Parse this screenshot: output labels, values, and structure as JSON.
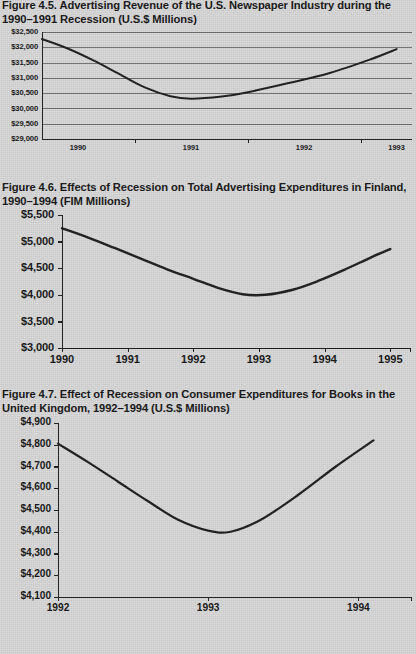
{
  "page": {
    "background_color": "#d7d7d7",
    "text_color": "#111111",
    "line_color": "#1a1a1a"
  },
  "figures": [
    {
      "id": "figure-4-5",
      "title": "Figure 4.5.  Advertising Revenue of the U.S. Newspaper Industry during the 1990–1991 Recession (U.S.$ Millions)"
    },
    {
      "id": "figure-4-6",
      "title": "Figure 4.6.  Effects of Recession on Total Advertising Expenditures in Finland, 1990–1994 (FIM Millions)"
    },
    {
      "id": "figure-4-7",
      "title": "Figure 4.7.  Effect of Recession on Consumer Expenditures for Books in the United Kingdom, 1992–1994 (U.S.$ Millions)"
    }
  ],
  "chart_data": [
    {
      "type": "line",
      "title": "Figure 4.5.  Advertising Revenue of the U.S. Newspaper Industry during the 1990–1991 Recession (U.S.$ Millions)",
      "xlabel": "",
      "ylabel": "",
      "grid": true,
      "legend": "none",
      "ytick_labels": [
        "$32,500",
        "$32,000",
        "$31,500",
        "$31,000",
        "$30,500",
        "$30,000",
        "$29,500",
        "$29,000"
      ],
      "ytick_values": [
        32500,
        32000,
        31500,
        31000,
        30500,
        30000,
        29500,
        29000
      ],
      "ylim": [
        29000,
        32500
      ],
      "xtick_labels": [
        "1990",
        "1991",
        "1992",
        "1993"
      ],
      "xlim": [
        1990,
        1993.6
      ],
      "series": [
        {
          "name": "U.S. newspaper advertising revenue",
          "x": [
            1990.0,
            1990.25,
            1990.5,
            1990.75,
            1991.0,
            1991.25,
            1991.45,
            1991.75,
            1992.0,
            1992.4,
            1992.8,
            1993.2,
            1993.45
          ],
          "values": [
            32270,
            31960,
            31570,
            31130,
            30690,
            30400,
            30320,
            30390,
            30530,
            30830,
            31160,
            31610,
            31940
          ]
        }
      ]
    },
    {
      "type": "line",
      "title": "Figure 4.6.  Effects of Recession on Total Advertising Expenditures in Finland, 1990–1994 (FIM Millions)",
      "xlabel": "",
      "ylabel": "",
      "grid": false,
      "legend": "none",
      "ytick_labels": [
        "$5,500",
        "$5,000",
        "$4,500",
        "$4,000",
        "$3,500",
        "$3,000"
      ],
      "ytick_values": [
        5500,
        5000,
        4500,
        4000,
        3500,
        3000
      ],
      "ylim": [
        3000,
        5500
      ],
      "xtick_labels": [
        "1990",
        "1991",
        "1992",
        "1993",
        "1994",
        "1995"
      ],
      "xlim": [
        1990,
        1995.3
      ],
      "series": [
        {
          "name": "Total advertising expenditures in Finland",
          "x": [
            1990.0,
            1990.4,
            1990.8,
            1991.2,
            1991.6,
            1992.0,
            1992.4,
            1992.75,
            1993.1,
            1993.5,
            1993.9,
            1994.3,
            1994.7,
            1995.0
          ],
          "values": [
            5250,
            5075,
            4880,
            4680,
            4480,
            4300,
            4120,
            4010,
            4000,
            4090,
            4260,
            4470,
            4700,
            4860
          ]
        }
      ]
    },
    {
      "type": "line",
      "title": "Figure 4.7.  Effect of Recession on Consumer Expenditures for Books in the United Kingdom, 1992–1994 (U.S.$ Millions)",
      "xlabel": "",
      "ylabel": "",
      "grid": false,
      "legend": "none",
      "ytick_labels": [
        "$4,900",
        "$4,800",
        "$4,700",
        "$4,600",
        "$4,500",
        "$4,400",
        "$4,300",
        "$4,200",
        "$4,100"
      ],
      "ytick_values": [
        4900,
        4800,
        4700,
        4600,
        4500,
        4400,
        4300,
        4200,
        4100
      ],
      "ylim": [
        4100,
        4900
      ],
      "xtick_labels": [
        "1992",
        "1993",
        "1994"
      ],
      "xlim": [
        1992,
        1994.35
      ],
      "series": [
        {
          "name": "Consumer expenditures for books in the U.K.",
          "x": [
            1992.0,
            1992.2,
            1992.4,
            1992.6,
            1992.8,
            1993.0,
            1993.15,
            1993.35,
            1993.6,
            1993.85,
            1994.1
          ],
          "values": [
            4805,
            4720,
            4630,
            4540,
            4455,
            4405,
            4400,
            4455,
            4570,
            4700,
            4820
          ]
        }
      ]
    }
  ]
}
